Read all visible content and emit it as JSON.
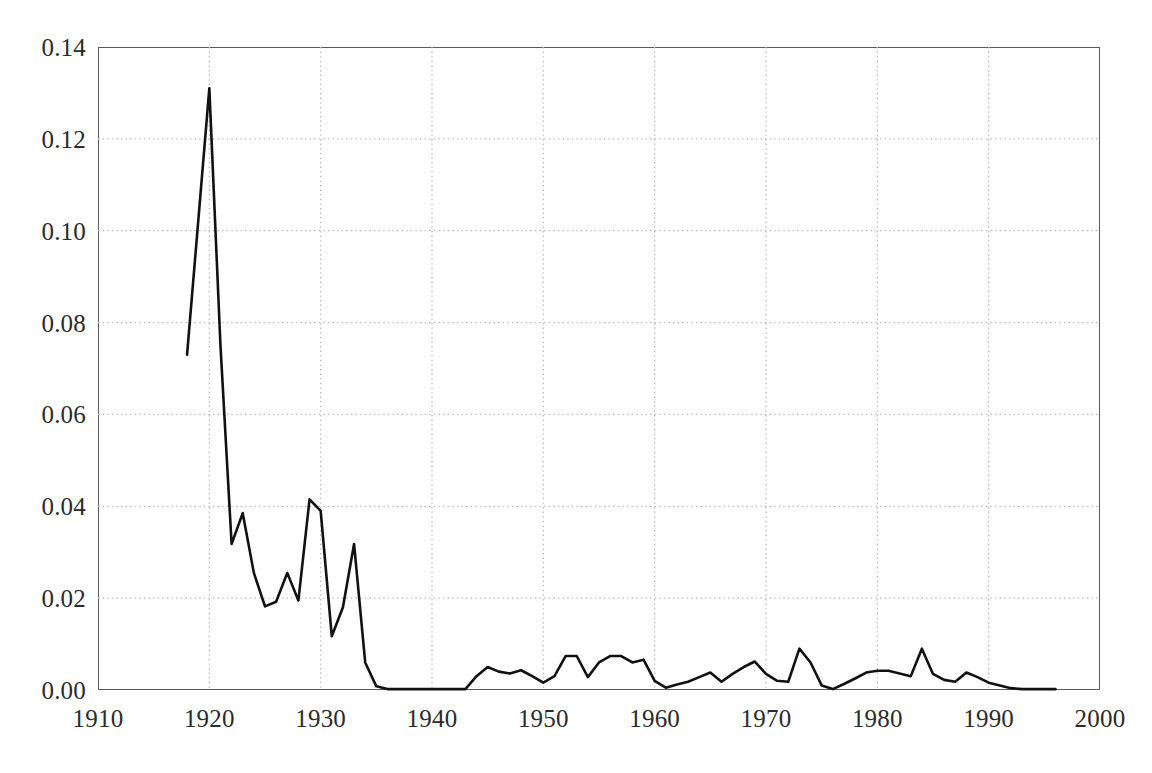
{
  "chart_data": {
    "type": "line",
    "title": "",
    "subtitle": "",
    "xlabel": "",
    "ylabel": "",
    "xlim": [
      1910,
      2000
    ],
    "ylim": [
      0.0,
      0.14
    ],
    "grid": true,
    "legend": null,
    "legend_position": "none",
    "xticks": [
      1910,
      1920,
      1930,
      1940,
      1950,
      1960,
      1970,
      1980,
      1990,
      2000
    ],
    "xtick_labels": [
      "1910",
      "1920",
      "1930",
      "1940",
      "1950",
      "1960",
      "1970",
      "1980",
      "1990",
      "2000"
    ],
    "yticks": [
      0.0,
      0.02,
      0.04,
      0.06,
      0.08,
      0.1,
      0.12,
      0.14
    ],
    "ytick_labels": [
      "0.00",
      "0.02",
      "0.04",
      "0.06",
      "0.08",
      "0.10",
      "0.12",
      "0.14"
    ],
    "series": [
      {
        "name": "series-1",
        "color": "#111111",
        "line_width": 2.6,
        "x": [
          1918,
          1919,
          1920,
          1921,
          1922,
          1923,
          1924,
          1925,
          1926,
          1927,
          1928,
          1929,
          1930,
          1931,
          1932,
          1933,
          1934,
          1935,
          1936,
          1937,
          1938,
          1939,
          1940,
          1941,
          1942,
          1943,
          1944,
          1945,
          1946,
          1947,
          1948,
          1949,
          1950,
          1951,
          1952,
          1953,
          1954,
          1955,
          1956,
          1957,
          1958,
          1959,
          1960,
          1961,
          1962,
          1963,
          1964,
          1965,
          1966,
          1967,
          1968,
          1969,
          1970,
          1971,
          1972,
          1973,
          1974,
          1975,
          1976,
          1977,
          1978,
          1979,
          1980,
          1981,
          1982,
          1983,
          1984,
          1985,
          1986,
          1987,
          1988,
          1989,
          1990,
          1991,
          1992,
          1993,
          1994,
          1995,
          1996
        ],
        "y": [
          0.073,
          0.102,
          0.131,
          0.075,
          0.0318,
          0.0385,
          0.0255,
          0.0182,
          0.0192,
          0.0255,
          0.0195,
          0.0415,
          0.039,
          0.0117,
          0.018,
          0.0318,
          0.006,
          0.0008,
          0.0002,
          0.0002,
          0.0002,
          0.0002,
          0.0002,
          0.0002,
          0.0002,
          0.0002,
          0.003,
          0.005,
          0.004,
          0.0036,
          0.0043,
          0.003,
          0.0016,
          0.003,
          0.0074,
          0.0074,
          0.0028,
          0.006,
          0.0074,
          0.0074,
          0.006,
          0.0066,
          0.002,
          0.0005,
          0.0012,
          0.0018,
          0.0028,
          0.0038,
          0.0018,
          0.0035,
          0.005,
          0.0062,
          0.0035,
          0.002,
          0.0018,
          0.009,
          0.006,
          0.001,
          0.0002,
          0.0013,
          0.0025,
          0.0038,
          0.0042,
          0.0042,
          0.0036,
          0.003,
          0.009,
          0.0035,
          0.0022,
          0.0018,
          0.0038,
          0.0028,
          0.0016,
          0.001,
          0.0004,
          0.0002,
          0.0002,
          0.0002,
          0.0002
        ]
      }
    ]
  },
  "axes": {
    "frame_color": "#5b5b5b",
    "grid_color": "#b9b9b9",
    "tick_text_color": "#2b2b2b"
  }
}
